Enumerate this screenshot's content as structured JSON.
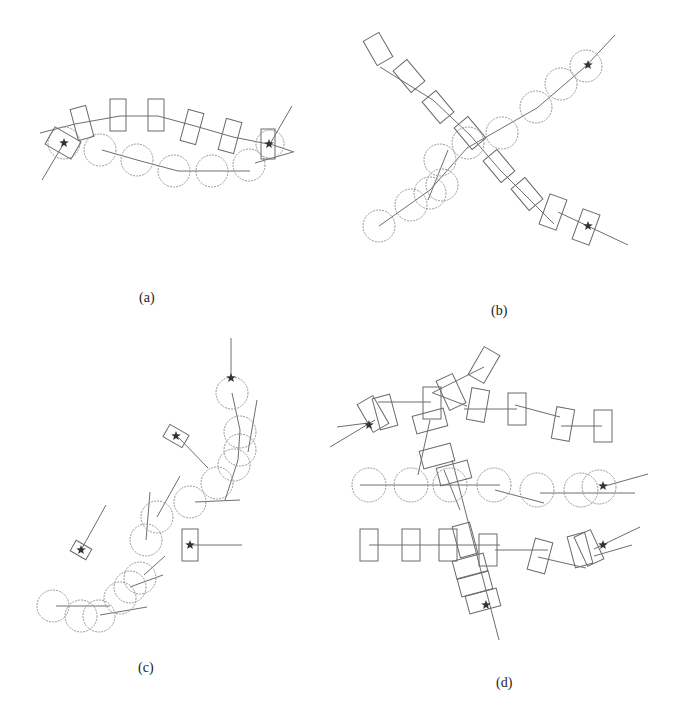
{
  "figure": {
    "panels": [
      {
        "id": "a",
        "label": "(a)",
        "label_pos": [
          148,
          300
        ],
        "circles": [
          [
            64,
            143,
            16
          ],
          [
            100,
            150,
            16
          ],
          [
            137,
            160,
            16
          ],
          [
            174,
            171,
            16
          ],
          [
            212,
            171,
            16
          ],
          [
            249,
            165,
            16
          ],
          [
            270,
            144,
            14
          ]
        ],
        "rects": [
          [
            63,
            143,
            20,
            30,
            -60
          ],
          [
            82,
            123,
            16,
            32,
            -15
          ],
          [
            118,
            115,
            16,
            32,
            0
          ],
          [
            156,
            115,
            16,
            32,
            0
          ],
          [
            192,
            127,
            16,
            32,
            15
          ],
          [
            230,
            136,
            16,
            32,
            15
          ],
          [
            268,
            144,
            14,
            30,
            0
          ]
        ],
        "lines": [
          [
            [
              40,
              133
            ],
            [
              75,
              124
            ],
            [
              120,
              116
            ],
            [
              158,
              116
            ],
            [
              195,
              126
            ],
            [
              233,
              137
            ],
            [
              268,
              144
            ]
          ],
          [
            [
              102,
              150
            ],
            [
              137,
              160
            ],
            [
              178,
              171
            ],
            [
              250,
              171
            ]
          ],
          [
            [
              64,
              143
            ],
            [
              42,
              180
            ]
          ],
          [
            [
              270,
              144
            ],
            [
              292,
              106
            ]
          ],
          [
            [
              270,
              144
            ],
            [
              294,
              152
            ]
          ],
          [
            [
              255,
              163
            ],
            [
              293,
              152
            ]
          ]
        ],
        "stars": [
          [
            64,
            143
          ],
          [
            269,
            144
          ]
        ]
      },
      {
        "id": "b",
        "label": "(b)",
        "label_pos": [
          500,
          313
        ],
        "circles": [
          [
            379,
            226,
            16
          ],
          [
            411,
            205,
            16
          ],
          [
            430,
            193,
            16
          ],
          [
            442,
            185,
            16
          ],
          [
            440,
            160,
            16
          ],
          [
            468,
            143,
            16
          ],
          [
            502,
            133,
            16
          ],
          [
            536,
            107,
            16
          ],
          [
            561,
            84,
            16
          ],
          [
            586,
            66,
            16
          ]
        ],
        "rects": [
          [
            378,
            49,
            18,
            28,
            -30
          ],
          [
            409,
            76,
            18,
            28,
            -40
          ],
          [
            438,
            107,
            18,
            28,
            -40
          ],
          [
            470,
            133,
            18,
            28,
            -40
          ],
          [
            499,
            166,
            18,
            28,
            -40
          ],
          [
            527,
            194,
            18,
            28,
            -40
          ],
          [
            553,
            212,
            18,
            32,
            20
          ],
          [
            586,
            227,
            18,
            32,
            20
          ]
        ],
        "lines": [
          [
            [
              380,
              67
            ],
            [
              433,
              100
            ],
            [
              470,
              135
            ],
            [
              500,
              170
            ],
            [
              554,
              224
            ]
          ],
          [
            [
              558,
              212
            ],
            [
              628,
              245
            ]
          ],
          [
            [
              379,
              226
            ],
            [
              430,
              190
            ],
            [
              467,
              148
            ],
            [
              537,
              108
            ],
            [
              586,
              66
            ],
            [
              615,
              35
            ]
          ],
          [
            [
              428,
              200
            ],
            [
              448,
              150
            ]
          ]
        ],
        "stars": [
          [
            588,
            65
          ],
          [
            588,
            226
          ]
        ]
      },
      {
        "id": "c",
        "label": "(c)",
        "label_pos": [
          147,
          670
        ],
        "circles": [
          [
            53,
            606,
            16
          ],
          [
            81,
            616,
            16
          ],
          [
            99,
            616,
            16
          ],
          [
            120,
            598,
            16
          ],
          [
            130,
            587,
            16
          ],
          [
            140,
            578,
            16
          ],
          [
            146,
            540,
            16
          ],
          [
            157,
            517,
            16
          ],
          [
            190,
            502,
            16
          ],
          [
            217,
            483,
            16
          ],
          [
            234,
            465,
            16
          ],
          [
            240,
            450,
            16
          ],
          [
            240,
            432,
            16
          ],
          [
            232,
            393,
            16
          ]
        ],
        "rects": [
          [
            81,
            550,
            12,
            18,
            -60
          ],
          [
            176,
            436,
            14,
            22,
            -60
          ],
          [
            190,
            545,
            16,
            32,
            0
          ]
        ],
        "lines": [
          [
            [
              231,
              379
            ],
            [
              231,
              338
            ]
          ],
          [
            [
              232,
              393
            ],
            [
              240,
              430
            ],
            [
              238,
              460
            ],
            [
              225,
              500
            ]
          ],
          [
            [
              179,
              438
            ],
            [
              208,
              468
            ]
          ],
          [
            [
              191,
              545
            ],
            [
              242,
              545
            ]
          ],
          [
            [
              81,
              550
            ],
            [
              106,
              505
            ]
          ],
          [
            [
              56,
              606
            ],
            [
              110,
              606
            ]
          ],
          [
            [
              195,
              502
            ],
            [
              240,
              500
            ]
          ],
          [
            [
              146,
              540
            ],
            [
              150,
              492
            ]
          ],
          [
            [
              157,
              517
            ],
            [
              180,
              476
            ]
          ],
          [
            [
              144,
              575
            ],
            [
              165,
              556
            ]
          ],
          [
            [
              130,
              587
            ],
            [
              163,
              575
            ]
          ],
          [
            [
              100,
              615
            ],
            [
              147,
              607
            ]
          ],
          [
            [
              248,
              452
            ],
            [
              257,
              400
            ]
          ]
        ],
        "stars": [
          [
            231,
            378
          ],
          [
            176,
            436
          ],
          [
            81,
            550
          ],
          [
            190,
            545
          ]
        ]
      },
      {
        "id": "d",
        "label": "(d)",
        "label_pos": [
          505,
          685
        ],
        "circles": [
          [
            369,
            485,
            17
          ],
          [
            411,
            485,
            17
          ],
          [
            450,
            485,
            17
          ],
          [
            494,
            485,
            17
          ],
          [
            537,
            490,
            17
          ],
          [
            581,
            490,
            17
          ],
          [
            599,
            487,
            17
          ]
        ],
        "rects": [
          [
            373,
            414,
            18,
            32,
            -30
          ],
          [
            385,
            412,
            18,
            32,
            -15
          ],
          [
            432,
            403,
            18,
            32,
            0
          ],
          [
            451,
            392,
            18,
            32,
            -25
          ],
          [
            478,
            405,
            18,
            32,
            10
          ],
          [
            484,
            365,
            18,
            32,
            30
          ],
          [
            517,
            409,
            18,
            32,
            0
          ],
          [
            563,
            424,
            18,
            32,
            10
          ],
          [
            603,
            426,
            18,
            32,
            0
          ],
          [
            430,
            421,
            32,
            18,
            -15
          ],
          [
            437,
            456,
            32,
            18,
            -15
          ],
          [
            454,
            473,
            32,
            18,
            -15
          ],
          [
            369,
            545,
            18,
            32,
            0
          ],
          [
            411,
            545,
            18,
            32,
            0
          ],
          [
            448,
            545,
            18,
            32,
            0
          ],
          [
            465,
            540,
            18,
            32,
            -15
          ],
          [
            488,
            550,
            18,
            32,
            0
          ],
          [
            540,
            556,
            18,
            32,
            15
          ],
          [
            580,
            550,
            18,
            32,
            -15
          ],
          [
            589,
            548,
            18,
            32,
            -25
          ],
          [
            470,
            566,
            32,
            18,
            -15
          ],
          [
            475,
            584,
            32,
            18,
            -15
          ],
          [
            483,
            601,
            32,
            18,
            -15
          ]
        ],
        "lines": [
          [
            [
              337,
              427
            ],
            [
              368,
              423
            ]
          ],
          [
            [
              330,
              447
            ],
            [
              375,
              420
            ]
          ],
          [
            [
              378,
              402
            ],
            [
              431,
              402
            ]
          ],
          [
            [
              433,
              393
            ],
            [
              467,
              406
            ]
          ],
          [
            [
              464,
              409
            ],
            [
              517,
              409
            ]
          ],
          [
            [
              515,
              405
            ],
            [
              560,
              417
            ]
          ],
          [
            [
              561,
              426
            ],
            [
              602,
              426
            ]
          ],
          [
            [
              432,
              393
            ],
            [
              484,
              367
            ]
          ],
          [
            [
              430,
              420
            ],
            [
              418,
              475
            ]
          ],
          [
            [
              360,
              485
            ],
            [
              500,
              485
            ]
          ],
          [
            [
              495,
              490
            ],
            [
              544,
              503
            ]
          ],
          [
            [
              540,
              493
            ],
            [
              635,
              493
            ]
          ],
          [
            [
              605,
              486
            ],
            [
              648,
              474
            ]
          ],
          [
            [
              369,
              545
            ],
            [
              500,
              545
            ]
          ],
          [
            [
              495,
              550
            ],
            [
              548,
              550
            ]
          ],
          [
            [
              538,
              557
            ],
            [
              586,
              568
            ]
          ],
          [
            [
              594,
              549
            ],
            [
              640,
              527
            ]
          ],
          [
            [
              594,
              556
            ],
            [
              632,
              545
            ]
          ],
          [
            [
              452,
              460
            ],
            [
              499,
              640
            ]
          ],
          [
            [
              444,
              470
            ],
            [
              460,
              510
            ]
          ]
        ],
        "stars": [
          [
            369,
            425
          ],
          [
            603,
            486
          ],
          [
            603,
            545
          ],
          [
            486,
            605
          ]
        ]
      }
    ],
    "colors": {
      "circle_stroke": "#9a9a9a",
      "rect_stroke": "#6a6a6a",
      "path_stroke": "#6e6e6e",
      "star_fill": "#333333"
    }
  }
}
